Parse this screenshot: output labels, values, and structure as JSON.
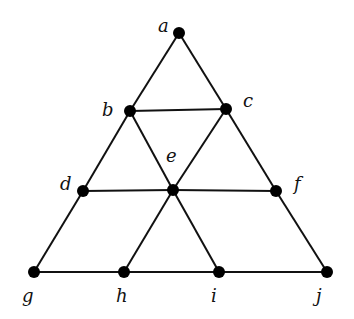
{
  "graph": {
    "nodes": [
      {
        "id": "a",
        "label": "a",
        "x": 179,
        "y": 33,
        "lx": 158,
        "ly": 32
      },
      {
        "id": "b",
        "label": "b",
        "x": 130,
        "y": 111,
        "lx": 102,
        "ly": 116
      },
      {
        "id": "c",
        "label": "c",
        "x": 226,
        "y": 109,
        "lx": 243,
        "ly": 107
      },
      {
        "id": "d",
        "label": "d",
        "x": 83,
        "y": 191,
        "lx": 60,
        "ly": 190
      },
      {
        "id": "e",
        "label": "e",
        "x": 173,
        "y": 190,
        "lx": 166,
        "ly": 162
      },
      {
        "id": "f",
        "label": "f",
        "x": 276,
        "y": 191,
        "lx": 294,
        "ly": 190
      },
      {
        "id": "g",
        "label": "g",
        "x": 34,
        "y": 272,
        "lx": 22,
        "ly": 302
      },
      {
        "id": "h",
        "label": "h",
        "x": 124,
        "y": 272,
        "lx": 116,
        "ly": 302
      },
      {
        "id": "i",
        "label": "i",
        "x": 219,
        "y": 272,
        "lx": 211,
        "ly": 302
      },
      {
        "id": "j",
        "label": "j",
        "x": 327,
        "y": 272,
        "lx": 316,
        "ly": 302
      }
    ],
    "edges": [
      [
        "a",
        "b"
      ],
      [
        "a",
        "c"
      ],
      [
        "b",
        "c"
      ],
      [
        "b",
        "d"
      ],
      [
        "b",
        "e"
      ],
      [
        "c",
        "e"
      ],
      [
        "c",
        "f"
      ],
      [
        "d",
        "e"
      ],
      [
        "e",
        "f"
      ],
      [
        "d",
        "g"
      ],
      [
        "e",
        "h"
      ],
      [
        "e",
        "i"
      ],
      [
        "f",
        "j"
      ],
      [
        "g",
        "h"
      ],
      [
        "h",
        "i"
      ],
      [
        "i",
        "j"
      ]
    ]
  }
}
